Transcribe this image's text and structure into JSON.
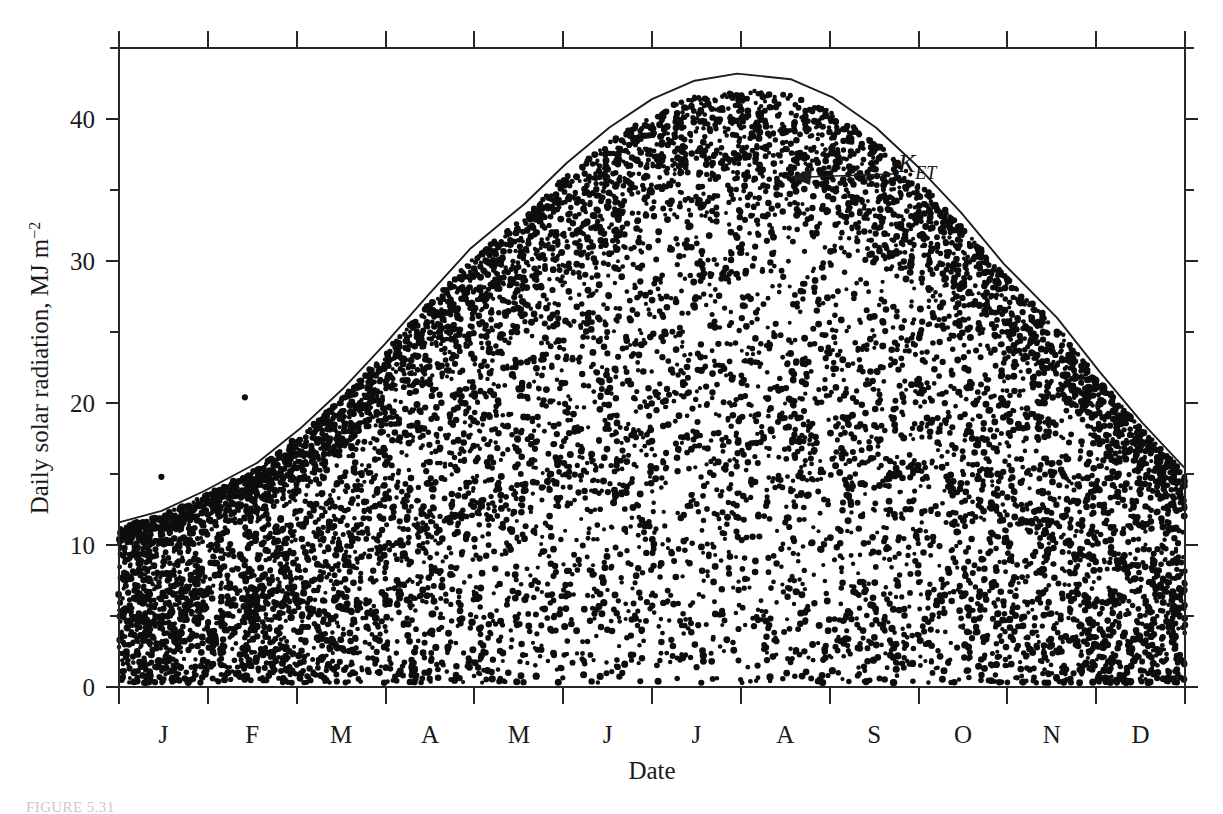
{
  "figure": {
    "caption": "FIGURE 5.31",
    "annotation": {
      "label_main": "K",
      "label_sub": "ET",
      "icon": "left-arrow-icon"
    }
  },
  "chart_data": {
    "type": "scatter",
    "title": "",
    "subtitle": "",
    "xlabel": "Date",
    "ylabel": "Daily solar radiation, MJ m−2",
    "ylabel_parts": {
      "text": "Daily solar radiation, MJ m",
      "exponent": "−2"
    },
    "grid": false,
    "legend_position": "none",
    "annotations": [
      {
        "text": "K_ET",
        "kind": "curve-label",
        "target": "extraterrestrial-radiation-curve",
        "x_month": "Sep",
        "y_value": 38.5
      }
    ],
    "ylim": [
      0,
      45
    ],
    "yticks_major": [
      0,
      10,
      20,
      30,
      40
    ],
    "yticks_minor": [
      5,
      15,
      25,
      35,
      45
    ],
    "ytick_labels": [
      "0",
      "10",
      "20",
      "30",
      "40"
    ],
    "xlim": [
      "Jan 1",
      "Dec 31"
    ],
    "xtick_labels": [
      "J",
      "F",
      "M",
      "A",
      "M",
      "J",
      "J",
      "A",
      "S",
      "O",
      "N",
      "D"
    ],
    "xtick_names": [
      "January",
      "February",
      "March",
      "April",
      "May",
      "June",
      "July",
      "August",
      "September",
      "October",
      "November",
      "December"
    ],
    "series": [
      {
        "name": "K_ET",
        "kind": "line",
        "description": "Extraterrestrial daily solar radiation envelope",
        "x_month_fraction": [
          0.0,
          0.04,
          0.08,
          0.13,
          0.17,
          0.21,
          0.25,
          0.29,
          0.33,
          0.38,
          0.42,
          0.46,
          0.5,
          0.54,
          0.58,
          0.63,
          0.67,
          0.71,
          0.75,
          0.79,
          0.83,
          0.88,
          0.92,
          0.96,
          1.0
        ],
        "values": [
          11.6,
          12.4,
          13.8,
          15.8,
          18.2,
          21.0,
          24.2,
          27.6,
          30.9,
          34.0,
          36.9,
          39.4,
          41.4,
          42.7,
          43.2,
          42.8,
          41.5,
          39.4,
          36.6,
          33.4,
          29.8,
          26.0,
          22.2,
          18.6,
          15.4
        ],
        "peak_value": 43.2,
        "peak_month": "late June",
        "min_value": 11.3,
        "min_month": "early December"
      },
      {
        "name": "Daily measured solar radiation",
        "kind": "scatter",
        "description": "Dense daily observations for one year, bounded above by K_ET",
        "n_points_approx": 10950,
        "value_range": [
          0.2,
          37.6
        ],
        "notable_outliers": [
          {
            "month": "January",
            "value": 14.8
          },
          {
            "month": "February",
            "value": 20.4
          },
          {
            "month": "June",
            "value": 37.6
          },
          {
            "month": "June",
            "value": 36.1
          }
        ]
      }
    ],
    "colors": {
      "line": "#1c1c1c",
      "points": "#0d0d0d",
      "axis": "#262626",
      "background": "#ffffff"
    }
  }
}
